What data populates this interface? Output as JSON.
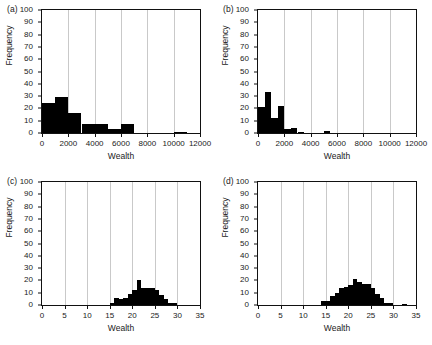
{
  "figure": {
    "background": "#ffffff",
    "bar_color": "#000000",
    "grid_color": "#c9c9c9",
    "axis_color": "#111111"
  },
  "panels": [
    {
      "tag": "(a)",
      "xlabel": "Wealth",
      "ylabel": "Frequency"
    },
    {
      "tag": "(b)",
      "xlabel": "Wealth",
      "ylabel": "Frequency"
    },
    {
      "tag": "(c)",
      "xlabel": "Wealth",
      "ylabel": "Frequency"
    },
    {
      "tag": "(d)",
      "xlabel": "Wealth",
      "ylabel": "Frequency"
    }
  ],
  "chart_data": [
    {
      "type": "bar",
      "panel": "(a)",
      "title": "",
      "xlabel": "Wealth",
      "ylabel": "Frequency",
      "xlim": [
        0,
        12000
      ],
      "ylim": [
        0,
        100
      ],
      "xticks": [
        0,
        2000,
        4000,
        6000,
        8000,
        10000,
        12000
      ],
      "xtick_labels": [
        "0",
        "2000",
        "4000",
        "6000",
        "8000",
        "10000",
        "12000"
      ],
      "yticks": [
        0,
        10,
        20,
        30,
        40,
        50,
        60,
        70,
        80,
        90,
        100
      ],
      "ytick_labels": [
        "0",
        "10",
        "20",
        "30",
        "40",
        "50",
        "60",
        "70",
        "80",
        "90",
        "100"
      ],
      "grid": "vertical",
      "legend": null,
      "bin_width": 1000,
      "bin_edges": [
        0,
        1000,
        2000,
        3000,
        4000,
        5000,
        6000,
        7000,
        8000,
        9000,
        10000,
        11000,
        12000
      ],
      "values": [
        24,
        29,
        16,
        7,
        7,
        3,
        7,
        0,
        0,
        0,
        1,
        0
      ]
    },
    {
      "type": "bar",
      "panel": "(b)",
      "title": "",
      "xlabel": "Wealth",
      "ylabel": "Frequency",
      "xlim": [
        0,
        12000
      ],
      "ylim": [
        0,
        100
      ],
      "xticks": [
        0,
        2000,
        4000,
        6000,
        8000,
        10000,
        12000
      ],
      "xtick_labels": [
        "0",
        "2000",
        "4000",
        "6000",
        "8000",
        "10000",
        "12000"
      ],
      "yticks": [
        0,
        10,
        20,
        30,
        40,
        50,
        60,
        70,
        80,
        90,
        100
      ],
      "ytick_labels": [
        "0",
        "10",
        "20",
        "30",
        "40",
        "50",
        "60",
        "70",
        "80",
        "90",
        "100"
      ],
      "grid": "vertical",
      "legend": null,
      "bin_width": 500,
      "bin_edges": [
        0,
        500,
        1000,
        1500,
        2000,
        2500,
        3000,
        3500,
        4000,
        4500,
        5000,
        5500,
        6000,
        6500,
        7000,
        7500,
        8000,
        8500,
        9000,
        9500,
        10000,
        10500,
        11000,
        11500,
        12000
      ],
      "values": [
        21,
        33,
        12,
        22,
        3,
        4,
        1,
        0,
        0,
        0,
        2,
        0,
        0,
        0,
        0,
        0,
        0,
        0,
        0,
        0,
        0,
        0,
        0,
        0
      ]
    },
    {
      "type": "bar",
      "panel": "(c)",
      "title": "",
      "xlabel": "Wealth",
      "ylabel": "Frequency",
      "xlim": [
        0,
        35
      ],
      "ylim": [
        0,
        100
      ],
      "xticks": [
        0,
        5,
        10,
        15,
        20,
        25,
        30,
        35
      ],
      "xtick_labels": [
        "0",
        "5",
        "10",
        "15",
        "20",
        "25",
        "30",
        "35"
      ],
      "yticks": [
        0,
        10,
        20,
        30,
        40,
        50,
        60,
        70,
        80,
        90,
        100
      ],
      "ytick_labels": [
        "0",
        "10",
        "20",
        "30",
        "40",
        "50",
        "60",
        "70",
        "80",
        "90",
        "100"
      ],
      "grid": "vertical",
      "legend": null,
      "bin_width": 1,
      "bin_edges": [
        15,
        16,
        17,
        18,
        19,
        20,
        21,
        22,
        23,
        24,
        25,
        26,
        27,
        28,
        29,
        30
      ],
      "values": [
        2,
        6,
        5,
        6,
        9,
        12,
        20,
        14,
        14,
        14,
        12,
        8,
        5,
        2,
        2
      ]
    },
    {
      "type": "bar",
      "panel": "(d)",
      "title": "",
      "xlabel": "Wealth",
      "ylabel": "Frequency",
      "xlim": [
        0,
        35
      ],
      "ylim": [
        0,
        100
      ],
      "xticks": [
        0,
        5,
        10,
        15,
        20,
        25,
        30,
        35
      ],
      "xtick_labels": [
        "0",
        "5",
        "10",
        "15",
        "20",
        "25",
        "30",
        "35"
      ],
      "yticks": [
        0,
        10,
        20,
        30,
        40,
        50,
        60,
        70,
        80,
        90,
        100
      ],
      "ytick_labels": [
        "0",
        "10",
        "20",
        "30",
        "40",
        "50",
        "60",
        "70",
        "80",
        "90",
        "100"
      ],
      "grid": "vertical",
      "legend": null,
      "bin_width": 1,
      "bin_edges": [
        14,
        15,
        16,
        17,
        18,
        19,
        20,
        21,
        22,
        23,
        24,
        25,
        26,
        27,
        28,
        29,
        30,
        31,
        32,
        33,
        34
      ],
      "values": [
        3,
        3,
        7,
        10,
        14,
        15,
        16,
        21,
        19,
        17,
        17,
        14,
        9,
        6,
        2,
        2,
        0,
        0,
        1,
        0
      ]
    }
  ]
}
